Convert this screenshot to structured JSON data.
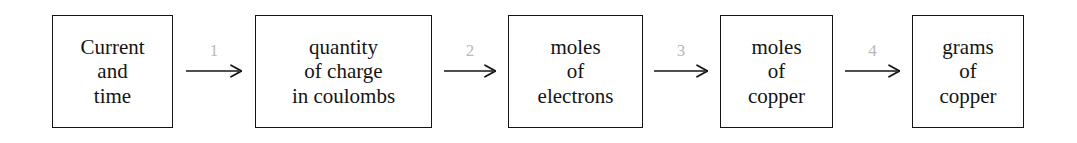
{
  "diagram": {
    "background_color": "#ffffff",
    "box_border_color": "#141414",
    "text_color": "#141414",
    "arrow_color": "#141414",
    "arrow_label_color": "#b9b9b9",
    "nodes": [
      {
        "id": "node-current-and-time",
        "lines": [
          "Current",
          "and",
          "time"
        ],
        "x": 52,
        "y": 15,
        "width": 121,
        "height": 113
      },
      {
        "id": "node-quantity-of-charge",
        "lines": [
          "quantity",
          "of charge",
          "in coulombs"
        ],
        "x": 255,
        "y": 15,
        "width": 177,
        "height": 113
      },
      {
        "id": "node-moles-of-electrons",
        "lines": [
          "moles",
          "of",
          "electrons"
        ],
        "x": 508,
        "y": 15,
        "width": 135,
        "height": 113
      },
      {
        "id": "node-moles-of-copper",
        "lines": [
          "moles",
          "of",
          "copper"
        ],
        "x": 720,
        "y": 15,
        "width": 113,
        "height": 113
      },
      {
        "id": "node-grams-of-copper",
        "lines": [
          "grams",
          "of",
          "copper"
        ],
        "x": 912,
        "y": 15,
        "width": 112,
        "height": 113
      }
    ],
    "arrows": [
      {
        "id": "arrow-1",
        "label": "1",
        "x": 186,
        "y": 42,
        "width": 56,
        "from": "node-current-and-time",
        "to": "node-quantity-of-charge"
      },
      {
        "id": "arrow-2",
        "label": "2",
        "x": 444,
        "y": 42,
        "width": 52,
        "from": "node-quantity-of-charge",
        "to": "node-moles-of-electrons"
      },
      {
        "id": "arrow-3",
        "label": "3",
        "x": 654,
        "y": 42,
        "width": 54,
        "from": "node-moles-of-electrons",
        "to": "node-moles-of-copper"
      },
      {
        "id": "arrow-4",
        "label": "4",
        "x": 845,
        "y": 42,
        "width": 55,
        "from": "node-moles-of-copper",
        "to": "node-grams-of-copper"
      }
    ]
  }
}
